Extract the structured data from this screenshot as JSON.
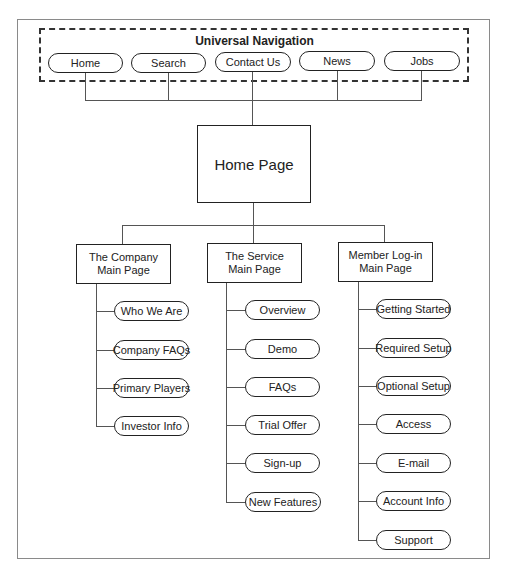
{
  "universal_nav": {
    "title": "Universal Navigation",
    "items": [
      "Home",
      "Search",
      "Contact Us",
      "News",
      "Jobs"
    ]
  },
  "home_page": {
    "label": "Home Page"
  },
  "sections": [
    {
      "label": "The Company Main Page",
      "children": [
        "Who We Are",
        "Company FAQs",
        "Primary Players",
        "Investor Info"
      ]
    },
    {
      "label": "The Service Main Page",
      "children": [
        "Overview",
        "Demo",
        "FAQs",
        "Trial Offer",
        "Sign-up",
        "New Features"
      ]
    },
    {
      "label": "Member Log-in Main Page",
      "children": [
        "Getting Started",
        "Required Setup",
        "Optional Setup",
        "Access",
        "E-mail",
        "Account Info",
        "Support"
      ]
    }
  ]
}
